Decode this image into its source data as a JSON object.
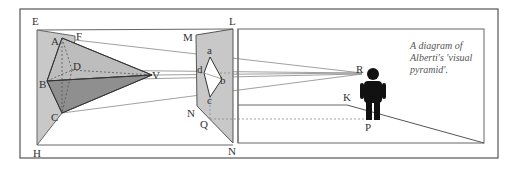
{
  "diagram": {
    "caption_lines": [
      "A diagram of",
      "Alberti's 'visual",
      "pyramid'."
    ],
    "colors": {
      "frame": "#555555",
      "line": "#666666",
      "light_fill": "#c8c8c8",
      "mid_fill": "#b4b4b4",
      "dark_fill": "#8f8f8f",
      "figure": "#111111",
      "dashed": "#888888"
    },
    "labels": {
      "E": "E",
      "F": "F",
      "A": "A",
      "D": "D",
      "B": "B",
      "C": "C",
      "V": "V",
      "H": "H",
      "M": "M",
      "L": "L",
      "a": "a",
      "d": "d",
      "b": "b",
      "c": "c",
      "N_upper": "N",
      "Q": "Q",
      "N_lower": "N",
      "R": "R",
      "K": "K",
      "P": "P"
    },
    "elements": {
      "object_plane": "EFH shaded plane",
      "object": "pyramid ABCD with apex V",
      "picture_plane": "MLN shaded plane with projected quadrilateral abcd",
      "viewer": "standing figure at R/P",
      "ground_line": "K to P"
    }
  }
}
